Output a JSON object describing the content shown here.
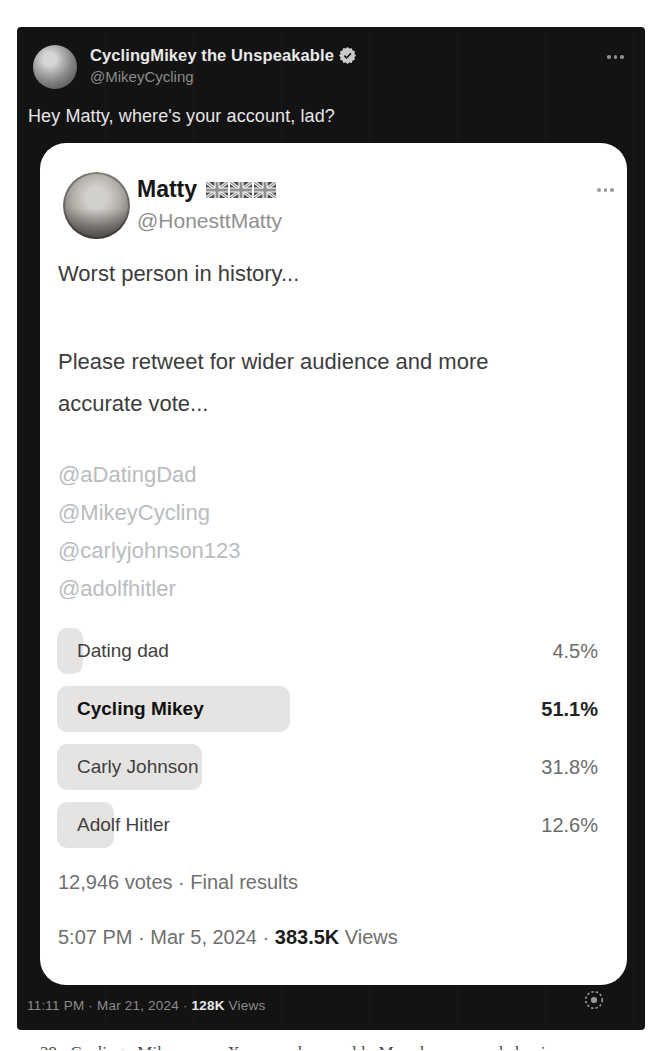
{
  "colors": {
    "dark_bg": "#131313",
    "card_bg": "#ffffff",
    "poll_bar_fill": "#e6e4e2",
    "muted_gray": "#8b8b8b"
  },
  "outer_tweet": {
    "display_name": "CyclingMikey the Unspeakable",
    "verified": "verified-badge",
    "handle": "@MikeyCycling",
    "text": "Hey Matty, where's your account, lad?"
  },
  "quoted_tweet": {
    "display_name": "Matty",
    "name_flags": [
      "uk-flag",
      "uk-flag",
      "uk-flag"
    ],
    "handle": "@HonesttMatty",
    "body_line1": "Worst person in history...",
    "body_line2": "Please retweet for wider audience and more accurate vote...",
    "mentions": [
      "@aDatingDad",
      "@MikeyCycling",
      "@carlyjohnson123",
      "@adolfhitler"
    ],
    "poll": {
      "options": [
        {
          "label": "Dating dad",
          "pct": 4.5,
          "pct_label": "4.5%",
          "winner": false
        },
        {
          "label": "Cycling Mikey",
          "pct": 51.1,
          "pct_label": "51.1%",
          "winner": true
        },
        {
          "label": "Carly Johnson",
          "pct": 31.8,
          "pct_label": "31.8%",
          "winner": false
        },
        {
          "label": "Adolf Hitler",
          "pct": 12.6,
          "pct_label": "12.6%",
          "winner": false
        }
      ],
      "votes_line": "12,946 votes · Final results"
    },
    "timestamp_prefix": "5:07 PM · Mar 5, 2024 · ",
    "views_count": "383.5K",
    "views_label": " Views"
  },
  "footer": {
    "timestamp_prefix": "11:11 PM · Mar 21, 2024 · ",
    "views_count": "128K",
    "views_label": " Views"
  },
  "page_caption_fragment": "29 Cycling Mikey, an X user, he could Mar he responded via commented",
  "chart_data": {
    "type": "bar",
    "title": "Worst person in history...",
    "categories": [
      "Dating dad",
      "Cycling Mikey",
      "Carly Johnson",
      "Adolf Hitler"
    ],
    "values": [
      4.5,
      51.1,
      31.8,
      12.6
    ],
    "unit": "%",
    "total_votes": "12,946",
    "status": "Final results"
  }
}
